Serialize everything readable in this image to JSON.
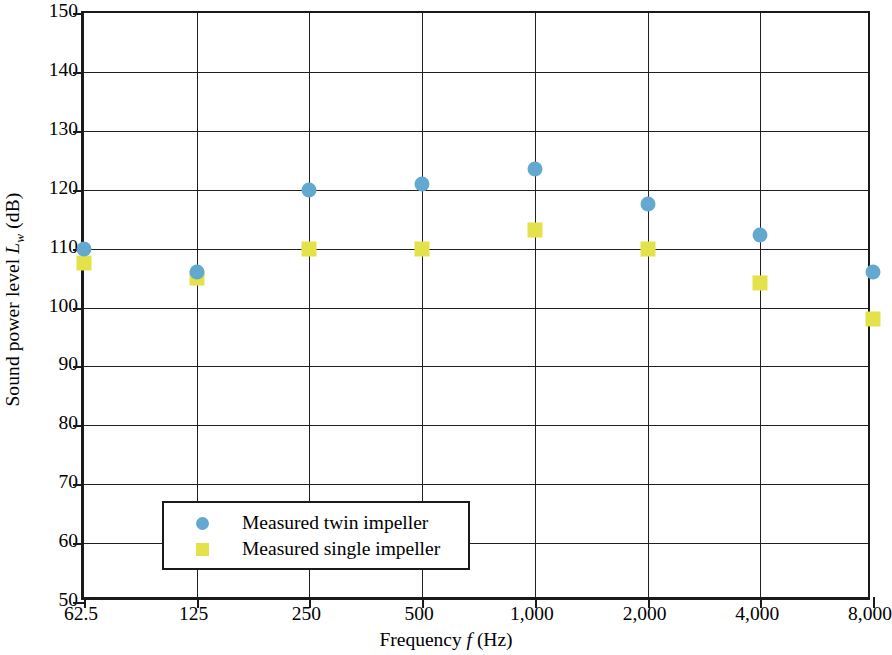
{
  "chart_data": {
    "type": "scatter",
    "title": "",
    "xlabel": "Frequency f (Hz)",
    "ylabel": "Sound power level Lw (dB)",
    "ylabel_parts": {
      "prefix": "Sound power level ",
      "symbol": "L",
      "subscript": "w",
      "suffix": " (dB)"
    },
    "xlabel_parts": {
      "prefix": "Frequency ",
      "symbol": "f",
      "suffix": " (Hz)"
    },
    "categories": [
      "62.5",
      "125",
      "250",
      "500",
      "1,000",
      "2,000",
      "4,000",
      "8,000"
    ],
    "x_values": [
      62.5,
      125,
      250,
      500,
      1000,
      2000,
      4000,
      8000
    ],
    "x_scale": "log-octave-bands",
    "ylim": [
      50,
      150
    ],
    "y_ticks": [
      150,
      140,
      130,
      120,
      110,
      100,
      90,
      80,
      70,
      60,
      50
    ],
    "grid": true,
    "legend_position": "lower-left-inside",
    "series": [
      {
        "name": "Measured twin impeller",
        "marker": "circle",
        "color": "#63a8cf",
        "values": [
          110.0,
          106.0,
          120.0,
          121.0,
          123.5,
          117.5,
          112.3,
          106.0
        ]
      },
      {
        "name": "Measured single impeller",
        "marker": "square",
        "color": "#e3e24a",
        "values": [
          107.5,
          105.0,
          110.0,
          110.0,
          113.2,
          110.0,
          104.2,
          98.0
        ]
      }
    ]
  },
  "legend": {
    "entries": [
      {
        "label": "Measured twin impeller",
        "marker": "circle",
        "color": "#63a8cf"
      },
      {
        "label": "Measured single impeller",
        "marker": "square",
        "color": "#e3e24a"
      }
    ]
  },
  "colors": {
    "twin_impeller": "#63a8cf",
    "single_impeller": "#e3e24a",
    "axis": "#1a1a1a",
    "grid": "#231f20",
    "background": "#ffffff"
  }
}
